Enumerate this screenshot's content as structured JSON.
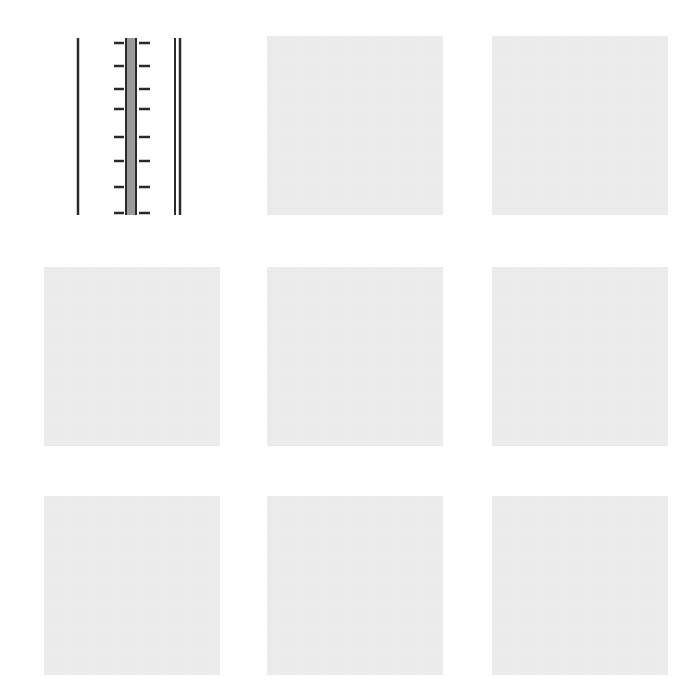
{
  "grid": {
    "rows": 3,
    "cols": 3,
    "tiles": [
      {
        "row": 0,
        "col": 0,
        "type": "drawing",
        "icon": "ruler-lines-icon",
        "description": "vertical lines with tick marks"
      },
      {
        "row": 0,
        "col": 1,
        "type": "blank"
      },
      {
        "row": 0,
        "col": 2,
        "type": "blank"
      },
      {
        "row": 1,
        "col": 0,
        "type": "blank"
      },
      {
        "row": 1,
        "col": 1,
        "type": "blank"
      },
      {
        "row": 1,
        "col": 2,
        "type": "blank"
      },
      {
        "row": 2,
        "col": 0,
        "type": "blank"
      },
      {
        "row": 2,
        "col": 1,
        "type": "blank"
      },
      {
        "row": 2,
        "col": 2,
        "type": "blank"
      }
    ],
    "colors": {
      "tile_fill": "#ececec",
      "line": "#2a2a2a",
      "center_bar": "#9a9a9a"
    }
  }
}
